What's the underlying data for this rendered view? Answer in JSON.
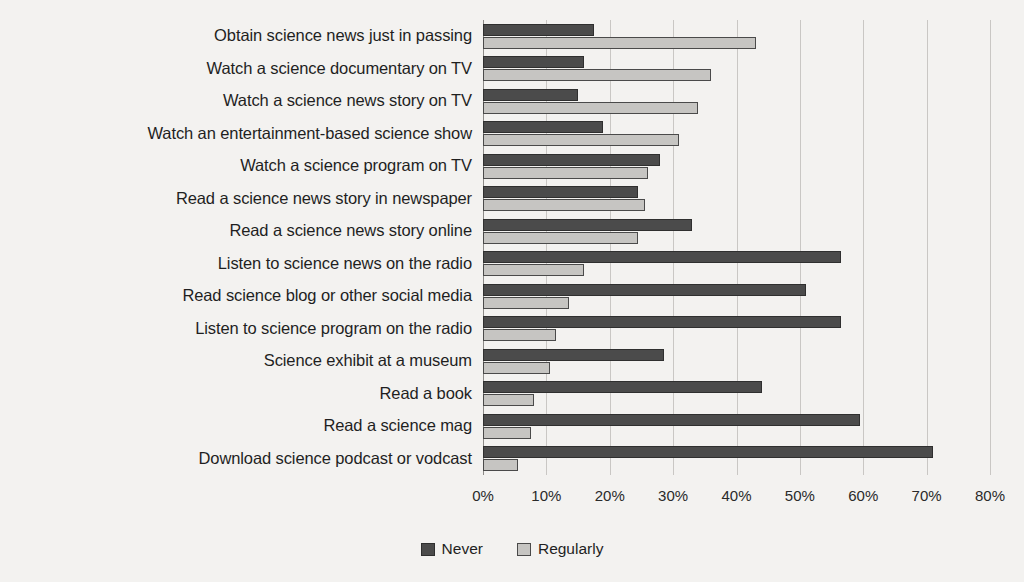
{
  "chart_data": {
    "type": "bar",
    "orientation": "horizontal",
    "title": "",
    "subtitle": "",
    "xlabel": "",
    "ylabel": "",
    "xlim": [
      0,
      80
    ],
    "xtick_labels": [
      "0%",
      "10%",
      "20%",
      "30%",
      "40%",
      "50%",
      "60%",
      "70%",
      "80%"
    ],
    "xticks": [
      0,
      10,
      20,
      30,
      40,
      50,
      60,
      70,
      80
    ],
    "grid": true,
    "grid_axis": "x",
    "legend_position": "bottom-center",
    "legend": [
      "Never",
      "Regularly"
    ],
    "categories": [
      "Obtain science news just in passing",
      "Watch a science documentary on TV",
      "Watch a science news story on TV",
      "Watch an entertainment-based science show",
      "Watch a science program on TV",
      "Read a science news story in newspaper",
      "Read a science news story online",
      "Listen to science news on the radio",
      "Read science blog or other social media",
      "Listen to science program on the radio",
      "Science exhibit at a museum",
      "Read a book",
      "Read a science mag",
      "Download science podcast or vodcast"
    ],
    "series": [
      {
        "name": "Never",
        "color": "#4b4b4b",
        "values": [
          17.5,
          16.0,
          15.0,
          19.0,
          28.0,
          24.5,
          33.0,
          56.5,
          51.0,
          56.5,
          28.5,
          44.0,
          59.5,
          71.0
        ]
      },
      {
        "name": "Regularly",
        "color": "#c6c5c2",
        "values": [
          43.0,
          36.0,
          34.0,
          31.0,
          26.0,
          25.5,
          24.5,
          16.0,
          13.5,
          11.5,
          10.5,
          8.0,
          7.5,
          5.5
        ]
      }
    ]
  },
  "legend_items": [
    {
      "label": "Never",
      "key": "never"
    },
    {
      "label": "Regularly",
      "key": "regularly"
    }
  ]
}
